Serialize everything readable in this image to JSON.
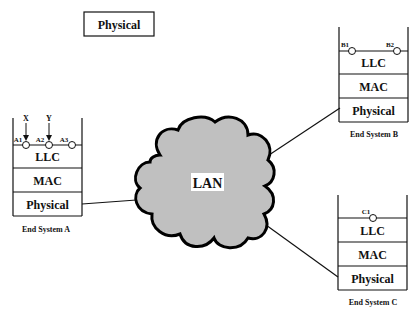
{
  "top_box": {
    "label": "Physical"
  },
  "cloud": {
    "label": "LAN",
    "fill": "#c0c0c0",
    "stroke": "#000000"
  },
  "systems": {
    "a": {
      "name": "End System A",
      "layers": [
        "LLC",
        "MAC",
        "Physical"
      ],
      "saps": [
        "A1",
        "A2",
        "A3"
      ],
      "arrows": [
        "X",
        "Y"
      ]
    },
    "b": {
      "name": "End System B",
      "layers": [
        "LLC",
        "MAC",
        "Physical"
      ],
      "saps": [
        "B1",
        "B2"
      ]
    },
    "c": {
      "name": "End System C",
      "layers": [
        "LLC",
        "MAC",
        "Physical"
      ],
      "saps": [
        "C1"
      ]
    }
  }
}
